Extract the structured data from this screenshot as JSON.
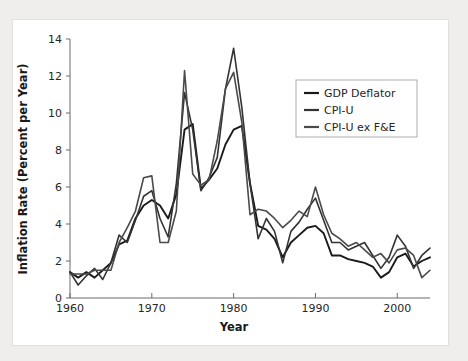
{
  "figure": {
    "background_color": "#f0eeed",
    "panel_color": "#ffffff"
  },
  "chart_data": {
    "type": "line",
    "title": "",
    "xlabel": "Year",
    "ylabel": "Inflation Rate (Percent per Year)",
    "xlim": [
      1960,
      2004
    ],
    "ylim": [
      0,
      14
    ],
    "xticks": [
      1960,
      1970,
      1980,
      1990,
      2000
    ],
    "xticklabels": [
      "1960",
      "1970",
      "1980",
      "1990",
      "2000"
    ],
    "yticks": [
      0,
      2,
      4,
      6,
      8,
      10,
      12,
      14
    ],
    "yticklabels": [
      "0",
      "2",
      "4",
      "6",
      "8",
      "10",
      "12",
      "14"
    ],
    "grid": false,
    "legend_position": "upper right",
    "x": [
      1960,
      1961,
      1962,
      1963,
      1964,
      1965,
      1966,
      1967,
      1968,
      1969,
      1970,
      1971,
      1972,
      1973,
      1974,
      1975,
      1976,
      1977,
      1978,
      1979,
      1980,
      1981,
      1982,
      1983,
      1984,
      1985,
      1986,
      1987,
      1988,
      1989,
      1990,
      1991,
      1992,
      1993,
      1994,
      1995,
      1996,
      1997,
      1998,
      1999,
      2000,
      2001,
      2002,
      2003,
      2004
    ],
    "series": [
      {
        "name": "GDP Deflator",
        "color": "#1a1a1a",
        "values": [
          1.4,
          1.1,
          1.4,
          1.1,
          1.5,
          1.9,
          2.9,
          3.1,
          4.3,
          5.0,
          5.3,
          5.0,
          4.3,
          5.6,
          9.1,
          9.4,
          5.9,
          6.4,
          7.0,
          8.3,
          9.1,
          9.3,
          6.2,
          3.9,
          3.7,
          3.2,
          2.2,
          3.0,
          3.4,
          3.8,
          3.9,
          3.5,
          2.3,
          2.3,
          2.1,
          2.0,
          1.9,
          1.7,
          1.1,
          1.4,
          2.2,
          2.4,
          1.7,
          2.0,
          2.2
        ]
      },
      {
        "name": "CPI-U",
        "color": "#333333",
        "values": [
          1.4,
          0.7,
          1.2,
          1.6,
          1.0,
          1.9,
          3.4,
          3.0,
          4.2,
          5.5,
          5.8,
          4.3,
          3.3,
          6.2,
          11.1,
          9.1,
          5.8,
          6.5,
          7.6,
          11.3,
          13.5,
          10.3,
          6.2,
          3.2,
          4.3,
          3.6,
          1.9,
          3.6,
          4.1,
          4.8,
          5.4,
          4.2,
          3.0,
          3.0,
          2.6,
          2.8,
          3.0,
          2.3,
          1.6,
          2.2,
          3.4,
          2.8,
          1.6,
          2.3,
          2.7
        ]
      },
      {
        "name": "CPI-U ex F&E",
        "color": "#4a4a4a",
        "values": [
          1.3,
          1.3,
          1.3,
          1.5,
          1.5,
          1.5,
          3.0,
          3.8,
          4.7,
          6.5,
          6.6,
          3.0,
          3.0,
          4.7,
          12.3,
          6.7,
          6.1,
          6.4,
          8.5,
          11.3,
          12.2,
          9.5,
          4.5,
          4.8,
          4.7,
          4.3,
          3.8,
          4.2,
          4.7,
          4.4,
          6.0,
          4.5,
          3.5,
          3.2,
          2.8,
          3.0,
          2.6,
          2.2,
          2.4,
          1.9,
          2.6,
          2.7,
          2.3,
          1.1,
          1.5
        ]
      }
    ]
  },
  "legend": {
    "entries": [
      {
        "label": "GDP Deflator"
      },
      {
        "label": "CPI-U"
      },
      {
        "label": "CPI-U ex F&E"
      }
    ]
  }
}
